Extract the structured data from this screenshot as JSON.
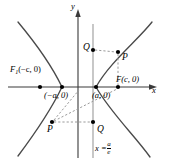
{
  "figure": {
    "type": "hyperbola-focus-directrix-diagram",
    "axes": {
      "x_label": "x",
      "y_label": "y",
      "origin_px": [
        78,
        87
      ]
    },
    "labels": {
      "focus_left": "F",
      "focus_left_sub": "1",
      "focus_left_coords": "(−c, 0)",
      "focus_right": "F(c, 0)",
      "vertex_left": "(−a, 0)",
      "vertex_right": "(a, 0)",
      "point_p_upper": "P",
      "point_p_lower": "P",
      "point_q_upper": "Q",
      "point_q_lower": "Q",
      "directrix_prefix": "x =",
      "directrix_num": "a",
      "directrix_den": "e"
    },
    "colors": {
      "curve": "#4a4a4a",
      "axis": "#3a3a3a",
      "directrix": "#9a9a9a",
      "dashed": "#9a9a9a",
      "dot": "#000000",
      "text": "#000000"
    },
    "points_px": {
      "focus_left": [
        40,
        87
      ],
      "vertex_left": [
        62,
        87
      ],
      "vertex_right": [
        96,
        87
      ],
      "focus_right": [
        118,
        87
      ],
      "q_upper": [
        93,
        50
      ],
      "p_upper": [
        118,
        52
      ],
      "q_lower": [
        93,
        122
      ],
      "p_lower": [
        52,
        122
      ]
    },
    "directrix_x_px": 93
  }
}
